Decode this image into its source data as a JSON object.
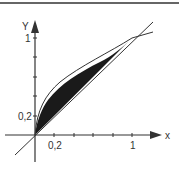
{
  "diagram": {
    "title": "",
    "curves": [
      "y = x",
      "y = sqrt(x)"
    ],
    "shaded_region": "between y = sqrt(x) and y = x for 0 <= x <= 1",
    "axes": {
      "x_label": "x",
      "y_label": "Y",
      "x_ticks": [
        "0,2",
        "1"
      ],
      "y_ticks": [
        "0,2",
        "1"
      ]
    },
    "colors": {
      "fill": "#1a1a1a",
      "line": "#333333"
    }
  }
}
